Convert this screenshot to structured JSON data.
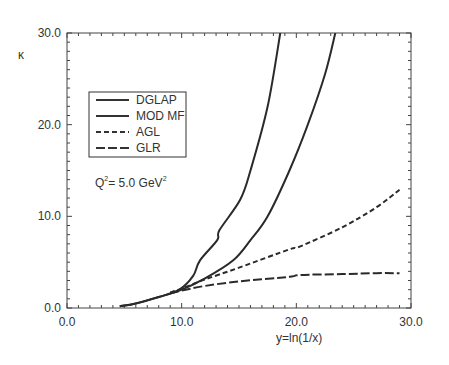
{
  "chart_data": {
    "type": "line",
    "title": "",
    "xlabel": "y=ln(1/x)",
    "ylabel": "κ",
    "xlim": [
      0,
      30
    ],
    "ylim": [
      0,
      30
    ],
    "x_ticks": [
      "0.0",
      "10.0",
      "20.0",
      "30.0"
    ],
    "y_ticks": [
      "0.0",
      "10.0",
      "20.0",
      "30.0"
    ],
    "grid": false,
    "legend_position": "upper-left inside",
    "annotation": {
      "text": "Q² = 5.0 GeV²",
      "base": "Q",
      "sup1": "2",
      "mid": "= 5.0 GeV",
      "sup2": "2"
    },
    "series": [
      {
        "name": "DGLAP",
        "style": "solid",
        "x": [
          4.6,
          6.0,
          8.0,
          9.8,
          11.0,
          11.6,
          13.1,
          13.3,
          15.1,
          16.0,
          17.5,
          18.6
        ],
        "y": [
          0.2,
          0.5,
          1.2,
          2.0,
          3.5,
          5.2,
          7.4,
          8.5,
          11.8,
          15.0,
          22.0,
          30.0
        ]
      },
      {
        "name": "MOD MF",
        "style": "solid",
        "x": [
          4.6,
          6.0,
          8.0,
          9.8,
          12.0,
          14.5,
          16.0,
          17.5,
          19.4,
          21.0,
          22.5,
          23.4
        ],
        "y": [
          0.2,
          0.5,
          1.2,
          1.9,
          3.2,
          5.2,
          7.4,
          10.0,
          15.0,
          20.0,
          25.5,
          30.0
        ]
      },
      {
        "name": "AGL",
        "style": "dashed",
        "x": [
          9.0,
          10.0,
          12.0,
          15.0,
          19.4,
          20.3,
          24.0,
          27.0,
          29.0
        ],
        "y": [
          1.7,
          2.1,
          3.1,
          4.4,
          6.4,
          6.7,
          8.8,
          11.0,
          12.9
        ]
      },
      {
        "name": "GLR",
        "style": "long-dashed",
        "x": [
          9.0,
          10.0,
          12.0,
          15.0,
          19.4,
          20.3,
          24.0,
          27.0,
          29.0
        ],
        "y": [
          1.6,
          1.9,
          2.4,
          2.9,
          3.4,
          3.6,
          3.7,
          3.8,
          3.8
        ]
      }
    ]
  }
}
